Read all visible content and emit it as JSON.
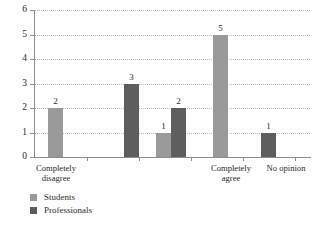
{
  "chart_data": {
    "type": "bar",
    "title": "",
    "subtitle": "",
    "xlabel": "",
    "ylabel": "",
    "ylim": [
      0,
      6
    ],
    "ytick_labels": [
      "0",
      "1",
      "2",
      "3",
      "4",
      "5",
      "6"
    ],
    "ytick_values": [
      0,
      1,
      2,
      3,
      4,
      5,
      6
    ],
    "grid": true,
    "grid_style": "dotted-horizontal",
    "legend_position": "bottom-left",
    "categories": [
      "Completely\ndisagree",
      "",
      "",
      "Completely\nagree",
      "No opinion"
    ],
    "category_tick_labels": [
      "Completely disagree",
      "",
      "",
      "Completely agree",
      "No opinion"
    ],
    "series": [
      {
        "name": "Students",
        "color": "#9a9a9a",
        "values": [
          2,
          null,
          1,
          5,
          null
        ]
      },
      {
        "name": "Professionals",
        "color": "#5e5e5e",
        "values": [
          null,
          3,
          2,
          null,
          1
        ]
      }
    ],
    "bars": [
      {
        "label": "2",
        "value": 2,
        "series": "Students",
        "category": "Completely disagree",
        "x": 14,
        "width": 15
      },
      {
        "label": "3",
        "value": 3,
        "series": "Professionals",
        "category": "",
        "x": 90,
        "width": 15
      },
      {
        "label": "1",
        "value": 1,
        "series": "Students",
        "category": "",
        "x": 122,
        "width": 15
      },
      {
        "label": "2",
        "value": 2,
        "series": "Professionals",
        "category": "",
        "x": 137,
        "width": 15
      },
      {
        "label": "5",
        "value": 5,
        "series": "Students",
        "category": "Completely agree",
        "x": 179,
        "width": 15
      },
      {
        "label": "1",
        "value": 1,
        "series": "Professionals",
        "category": "No opinion",
        "x": 227,
        "width": 15
      }
    ],
    "data_labels": [
      "2",
      "3",
      "1",
      "2",
      "5",
      "1"
    ]
  },
  "legend": {
    "items": [
      {
        "label": "Students",
        "color": "#9a9a9a"
      },
      {
        "label": "Professionals",
        "color": "#5e5e5e"
      }
    ]
  },
  "axis_labels": {
    "completely_disagree": "Completely\ndisagree",
    "completely_agree": "Completely\nagree",
    "no_opinion": "No opinion"
  }
}
